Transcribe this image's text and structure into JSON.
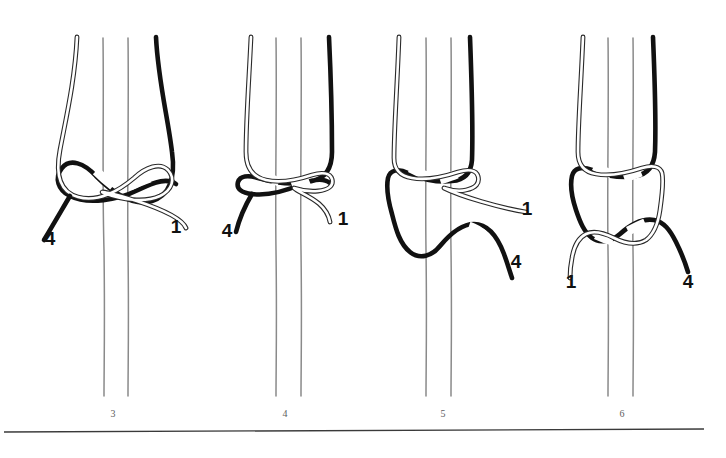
{
  "figure": {
    "background_color": "#ffffff",
    "dark_cord_color": "#111111",
    "light_cord_color": "#ffffff",
    "core_thread_color": "#8a8a8a",
    "rule_color": "#3a3a3a",
    "panel_number_color": "#5d5d5d",
    "label_color": "#111111"
  },
  "panels": [
    {
      "number": "3",
      "number_x": 113,
      "number_y": 417,
      "labels": [
        {
          "text": "4",
          "x": 50,
          "y": 245,
          "cord": "dark"
        },
        {
          "text": "1",
          "x": 176,
          "y": 233,
          "cord": "light"
        }
      ]
    },
    {
      "number": "4",
      "number_x": 285,
      "number_y": 417,
      "labels": [
        {
          "text": "4",
          "x": 227,
          "y": 237,
          "cord": "dark"
        },
        {
          "text": "1",
          "x": 343,
          "y": 225,
          "cord": "light"
        }
      ]
    },
    {
      "number": "5",
      "number_x": 443,
      "number_y": 417,
      "labels": [
        {
          "text": "1",
          "x": 525,
          "y": 215,
          "cord": "light"
        },
        {
          "text": "4",
          "x": 513,
          "y": 268,
          "cord": "dark"
        }
      ]
    },
    {
      "number": "6",
      "number_x": 622,
      "number_y": 417,
      "labels": [
        {
          "text": "1",
          "x": 571,
          "y": 285,
          "cord": "light"
        },
        {
          "text": "4",
          "x": 686,
          "y": 285,
          "cord": "dark"
        }
      ]
    }
  ],
  "footer_rule": {
    "x1": 4,
    "y1": 432,
    "x2": 704,
    "y2": 429
  }
}
